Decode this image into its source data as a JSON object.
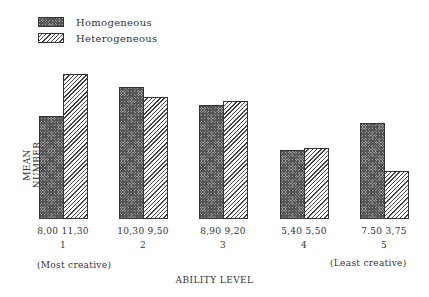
{
  "legend": {
    "items": [
      {
        "label": "Homogeneous",
        "pattern": "crosshatch"
      },
      {
        "label": "Heterogeneous",
        "pattern": "diagonal"
      }
    ]
  },
  "axes": {
    "ylabel": "MEAN NUMBER",
    "xlabel": "ABILITY LEVEL",
    "left_note": "(Most creative)",
    "right_note": "(Least creative)"
  },
  "groups": [
    {
      "level": "1",
      "hom_label": "8,00",
      "het_label": "11,30"
    },
    {
      "level": "2",
      "hom_label": "10,30",
      "het_label": "9,50"
    },
    {
      "level": "3",
      "hom_label": "8,90",
      "het_label": "9,20"
    },
    {
      "level": "4",
      "hom_label": "5,40",
      "het_label": "5,50"
    },
    {
      "level": "5",
      "hom_label": "7.50",
      "het_label": "3,75"
    }
  ],
  "chart_data": {
    "type": "bar",
    "title": "",
    "xlabel": "ABILITY LEVEL",
    "ylabel": "MEAN NUMBER",
    "categories": [
      "1",
      "2",
      "3",
      "4",
      "5"
    ],
    "category_notes": {
      "1": "(Most creative)",
      "5": "(Least creative)"
    },
    "series": [
      {
        "name": "Homogeneous",
        "values": [
          8.0,
          10.3,
          8.9,
          5.4,
          7.5
        ]
      },
      {
        "name": "Heterogeneous",
        "values": [
          11.3,
          9.5,
          9.2,
          5.5,
          3.75
        ]
      }
    ],
    "ylim": [
      0,
      11.3
    ],
    "grid": false,
    "legend_position": "top-left",
    "value_labels": true
  }
}
